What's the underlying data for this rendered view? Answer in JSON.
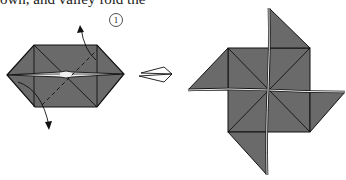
{
  "caption": {
    "text": "own, and valley fold the"
  },
  "step": {
    "number": "1"
  },
  "colors": {
    "paper": "#6a6a6a",
    "line": "#111111",
    "gap": "#f2f2f2",
    "background": "#ffffff"
  },
  "figures": [
    {
      "name": "folded-base-before",
      "description": "Hexagonal folded base with valley fold line and two arrows"
    },
    {
      "name": "result-arrow",
      "description": "Hollow outline arrow pointing right"
    },
    {
      "name": "pinwheel-result",
      "description": "Finished pinwheel with four flaps"
    }
  ]
}
